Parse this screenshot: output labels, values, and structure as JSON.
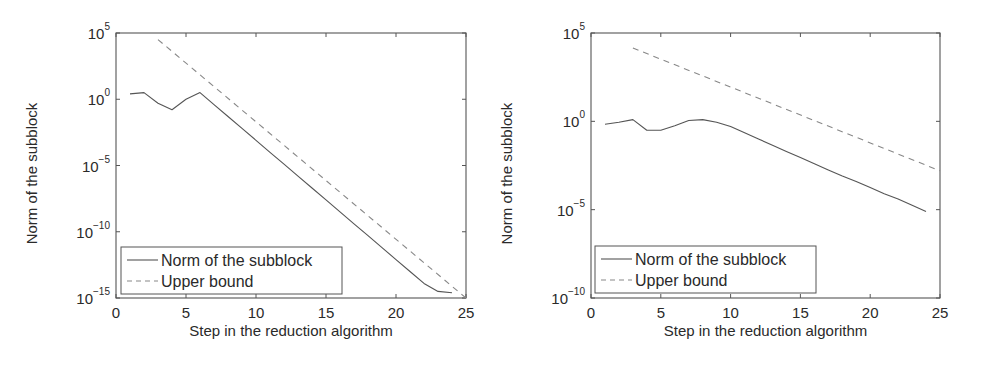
{
  "chart_data": [
    {
      "type": "line",
      "title": "",
      "xlabel": "Step in the reduction algorithm",
      "ylabel": "Norm of the subblock",
      "yscale": "log",
      "xlim": [
        0,
        25
      ],
      "ylim": [
        1e-15,
        100000.0
      ],
      "xticks": [
        0,
        5,
        10,
        15,
        20,
        25
      ],
      "xtick_labels": [
        "0",
        "5",
        "10",
        "15",
        "20",
        "25"
      ],
      "yticks_exp": [
        5,
        0,
        -5,
        -10,
        -15
      ],
      "ytick_labels": [
        "10^5",
        "10^0",
        "10^-5",
        "10^-10",
        "10^-15"
      ],
      "grid": false,
      "legend_position": "lower left",
      "series": [
        {
          "name": "Norm of the subblock",
          "style": "solid",
          "x": [
            1,
            2,
            3,
            4,
            5,
            6,
            7,
            8,
            9,
            10,
            11,
            12,
            13,
            14,
            15,
            16,
            17,
            18,
            19,
            20,
            21,
            22,
            23,
            24
          ],
          "log10_y": [
            0.4,
            0.5,
            -0.3,
            -0.8,
            0.0,
            0.5,
            -0.4,
            -1.3,
            -2.2,
            -3.1,
            -4.0,
            -4.9,
            -5.8,
            -6.7,
            -7.6,
            -8.5,
            -9.4,
            -10.3,
            -11.2,
            -12.1,
            -13.0,
            -13.9,
            -14.5,
            -14.6
          ]
        },
        {
          "name": "Upper bound",
          "style": "dashed",
          "x": [
            3,
            25
          ],
          "log10_y": [
            4.5,
            -15.0
          ]
        }
      ]
    },
    {
      "type": "line",
      "title": "",
      "xlabel": "Step in the reduction algorithm",
      "ylabel": "Norm of the subblock",
      "yscale": "log",
      "xlim": [
        0,
        25
      ],
      "ylim": [
        1e-10,
        100000.0
      ],
      "xticks": [
        0,
        5,
        10,
        15,
        20,
        25
      ],
      "xtick_labels": [
        "0",
        "5",
        "10",
        "15",
        "20",
        "25"
      ],
      "yticks_exp": [
        5,
        0,
        -5,
        -10
      ],
      "ytick_labels": [
        "10^5",
        "10^0",
        "10^-5",
        "10^-10"
      ],
      "grid": false,
      "legend_position": "lower left",
      "series": [
        {
          "name": "Norm of the subblock",
          "style": "solid",
          "x": [
            1,
            2,
            3,
            4,
            5,
            6,
            7,
            8,
            9,
            10,
            11,
            12,
            13,
            14,
            15,
            16,
            17,
            18,
            19,
            20,
            21,
            22,
            23,
            24
          ],
          "log10_y": [
            -0.17,
            -0.05,
            0.1,
            -0.5,
            -0.5,
            -0.25,
            0.05,
            0.1,
            -0.05,
            -0.3,
            -0.65,
            -1.0,
            -1.35,
            -1.7,
            -2.05,
            -2.4,
            -2.75,
            -3.1,
            -3.4,
            -3.75,
            -4.1,
            -4.4,
            -4.75,
            -5.1
          ]
        },
        {
          "name": "Upper bound",
          "style": "dashed",
          "x": [
            3,
            25
          ],
          "log10_y": [
            4.15,
            -2.8
          ]
        }
      ]
    }
  ],
  "colors": {
    "axis": "#555555",
    "solid_line": "#555555",
    "dashed_line": "#888888",
    "text": "#2a2a2a"
  }
}
